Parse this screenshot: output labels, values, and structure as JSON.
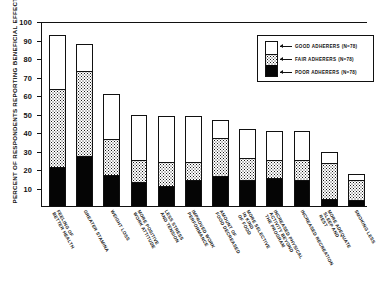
{
  "chart_data": {
    "type": "bar",
    "stacked": true,
    "title": "",
    "subtitle": "",
    "xlabel": "",
    "ylabel": "PERCENT OF RESPONDENTS REPORTING BENEFICIAL EFFECTS",
    "ylim": [
      0,
      100
    ],
    "ytick_labels": [
      "100",
      "90",
      "80",
      "70",
      "60",
      "50",
      "40",
      "30",
      "20",
      "10"
    ],
    "ytick_values": [
      100,
      90,
      80,
      70,
      60,
      50,
      40,
      30,
      20,
      10
    ],
    "grid": false,
    "legend_position": "top-right",
    "categories": [
      "FEELING OF BETTER HEALTH",
      "GREATER STAMINA",
      "WEIGHT LOSS",
      "MORE POSITIVE WORK ATTITUDE",
      "LESS STRESS AND TENSION",
      "IMPROVED WORK PERFORMANCE",
      "AMOUNT OF FOOD DECREASED",
      "MORE SELECTIVE IN KIND OF FOOD",
      "INCREASED PHYSICAL ACTIVITY BEYOND THE PROGRAM",
      "INCREASED RECREATION",
      "MORE ADEQUATE SLEEP AND REST",
      "SMOKING LESS"
    ],
    "series": [
      {
        "name": "GOOD ADHERERS",
        "n": 78,
        "swatch": "white",
        "values": [
          93,
          88,
          61,
          50,
          49,
          49,
          47,
          42,
          41,
          41,
          30,
          18
        ]
      },
      {
        "name": "FAIR ADHERERS",
        "n": 78,
        "swatch": "stipple",
        "values": [
          63,
          73,
          36,
          25,
          24,
          24,
          37,
          26,
          25,
          25,
          23,
          14
        ]
      },
      {
        "name": "POOR ADHERERS",
        "n": 78,
        "swatch": "black",
        "values": [
          21,
          27,
          17,
          13,
          11,
          14,
          16,
          14,
          15,
          14,
          4,
          3
        ]
      }
    ]
  },
  "legend": {
    "items": [
      {
        "label": "GOOD ADHERERS",
        "n_text": "(N=78)"
      },
      {
        "label": "FAIR  ADHERERS",
        "n_text": "(N=78)"
      },
      {
        "label": "POOR  ADHERERS",
        "n_text": "(N=78)"
      }
    ]
  }
}
